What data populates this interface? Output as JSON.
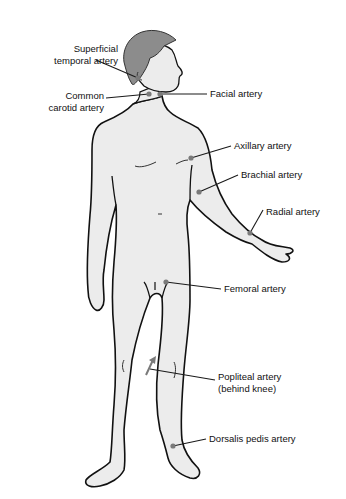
{
  "diagram": {
    "colors": {
      "skin": "#ececec",
      "outline": "#111111",
      "hair": "#8c8c8c",
      "marker": "#7a7a7a",
      "leader": "#1a1a1a",
      "background": "#ffffff"
    },
    "labels": [
      {
        "id": "superficial-temporal",
        "line1": "Superficial",
        "line2": "temporal artery",
        "x": 10,
        "y": 43,
        "align": "right",
        "w": 108,
        "marker": [
          138,
          78
        ],
        "leader_from": [
          96,
          60
        ]
      },
      {
        "id": "common-carotid",
        "line1": "Common",
        "line2": "carotid artery",
        "x": 10,
        "y": 90,
        "align": "right",
        "w": 94,
        "marker": [
          149,
          94
        ],
        "leader_from": [
          106,
          98
        ]
      },
      {
        "id": "facial",
        "line1": "Facial artery",
        "line2": "",
        "x": 210,
        "y": 88,
        "align": "left",
        "w": 100,
        "marker": [
          160,
          94
        ],
        "leader_from": [
          207,
          94
        ]
      },
      {
        "id": "axillary",
        "line1": "Axillary artery",
        "line2": "",
        "x": 234,
        "y": 140,
        "align": "left",
        "w": 100,
        "marker": [
          191,
          158
        ],
        "leader_from": [
          231,
          146
        ]
      },
      {
        "id": "brachial",
        "line1": "Brachial artery",
        "line2": "",
        "x": 241,
        "y": 169,
        "align": "left",
        "w": 100,
        "marker": [
          199,
          192
        ],
        "leader_from": [
          238,
          175
        ]
      },
      {
        "id": "radial",
        "line1": "Radial artery",
        "line2": "",
        "x": 266,
        "y": 206,
        "align": "left",
        "w": 80,
        "marker": [
          250,
          233
        ],
        "leader_from": [
          263,
          210
        ]
      },
      {
        "id": "femoral",
        "line1": "Femoral artery",
        "line2": "",
        "x": 224,
        "y": 283,
        "align": "left",
        "w": 100,
        "marker": [
          166,
          282
        ],
        "leader_from": [
          221,
          289
        ]
      },
      {
        "id": "popliteal",
        "line1": "Popliteal artery",
        "line2": "(behind knee)",
        "x": 218,
        "y": 371,
        "align": "left",
        "w": 110,
        "marker": [
          150,
          369
        ],
        "leader_from": [
          215,
          380
        ]
      },
      {
        "id": "dorsalis-pedis",
        "line1": "Dorsalis pedis artery",
        "line2": "",
        "x": 209,
        "y": 433,
        "align": "left",
        "w": 130,
        "marker": [
          173,
          446
        ],
        "leader_from": [
          206,
          439
        ]
      }
    ]
  }
}
